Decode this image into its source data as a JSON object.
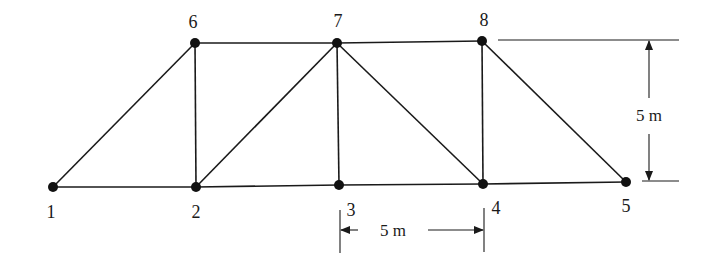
{
  "figure": {
    "type": "plane-truss",
    "nodes": [
      {
        "id": "1",
        "label": "1",
        "x": 53,
        "y": 187,
        "label_x": 51,
        "label_y": 218
      },
      {
        "id": "2",
        "label": "2",
        "x": 196,
        "y": 187,
        "label_x": 196,
        "label_y": 218
      },
      {
        "id": "3",
        "label": "3",
        "x": 339,
        "y": 185,
        "label_x": 351,
        "label_y": 216
      },
      {
        "id": "4",
        "label": "4",
        "x": 483,
        "y": 184,
        "label_x": 496,
        "label_y": 214
      },
      {
        "id": "5",
        "label": "5",
        "x": 626,
        "y": 182,
        "label_x": 626,
        "label_y": 212
      },
      {
        "id": "6",
        "label": "6",
        "x": 195,
        "y": 43,
        "label_x": 193,
        "label_y": 28
      },
      {
        "id": "7",
        "label": "7",
        "x": 337,
        "y": 43,
        "label_x": 338,
        "label_y": 27
      },
      {
        "id": "8",
        "label": "8",
        "x": 482,
        "y": 41,
        "label_x": 484,
        "label_y": 26
      }
    ],
    "members": [
      [
        "1",
        "2"
      ],
      [
        "2",
        "3"
      ],
      [
        "3",
        "4"
      ],
      [
        "4",
        "5"
      ],
      [
        "6",
        "7"
      ],
      [
        "7",
        "8"
      ],
      [
        "1",
        "6"
      ],
      [
        "2",
        "6"
      ],
      [
        "2",
        "7"
      ],
      [
        "3",
        "7"
      ],
      [
        "7",
        "4"
      ],
      [
        "4",
        "8"
      ],
      [
        "8",
        "5"
      ]
    ],
    "dimensions": {
      "horizontal": {
        "label": "5 m",
        "from_node": "3",
        "to_node": "4"
      },
      "vertical": {
        "label": "5 m",
        "from": "top chord",
        "to": "bottom chord"
      }
    }
  }
}
